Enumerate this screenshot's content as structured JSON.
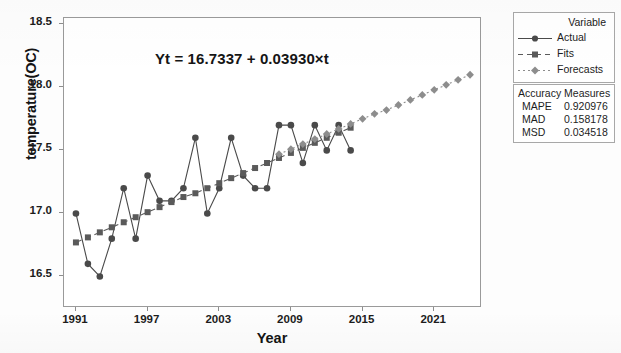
{
  "chart_data": {
    "type": "line",
    "title": "",
    "xlabel": "Year",
    "ylabel": "temperature(OC)",
    "annotation": "Yt = 16.7337 + 0.03930×t",
    "xlim": [
      1990,
      2025
    ],
    "ylim": [
      16.25,
      18.55
    ],
    "xticks": [
      "1991",
      "1997",
      "2003",
      "2009",
      "2015",
      "2021"
    ],
    "xtick_values": [
      1991,
      1997,
      2003,
      2009,
      2015,
      2021
    ],
    "yticks": [
      "16.5",
      "17.0",
      "17.5",
      "18.0",
      "18.5"
    ],
    "ytick_values": [
      16.5,
      17.0,
      17.5,
      18.0,
      18.5
    ],
    "grid": false,
    "legend_position": "right",
    "legend_title": "Variable",
    "series": [
      {
        "name": "Actual",
        "marker": "circle",
        "line": "solid",
        "color": "#4a4a4a",
        "x": [
          1991,
          1992,
          1993,
          1994,
          1995,
          1996,
          1997,
          1998,
          1999,
          2000,
          2001,
          2002,
          2003,
          2004,
          2005,
          2006,
          2007,
          2008,
          2009,
          2010,
          2011,
          2012,
          2013,
          2014
        ],
        "values": [
          17.0,
          16.6,
          16.5,
          16.8,
          17.2,
          16.8,
          17.3,
          17.1,
          17.1,
          17.2,
          17.6,
          17.0,
          17.2,
          17.6,
          17.3,
          17.2,
          17.2,
          17.7,
          17.7,
          17.4,
          17.7,
          17.5,
          17.7,
          17.5
        ]
      },
      {
        "name": "Fits",
        "marker": "square",
        "line": "dashed",
        "color": "#5a5a5a",
        "x": [
          1991,
          1992,
          1993,
          1994,
          1995,
          1996,
          1997,
          1998,
          1999,
          2000,
          2001,
          2002,
          2003,
          2004,
          2005,
          2006,
          2007,
          2008,
          2009,
          2010,
          2011,
          2012,
          2013,
          2014
        ],
        "values": [
          16.77,
          16.81,
          16.85,
          16.89,
          16.93,
          16.97,
          17.01,
          17.05,
          17.09,
          17.13,
          17.16,
          17.2,
          17.24,
          17.28,
          17.32,
          17.36,
          17.4,
          17.44,
          17.48,
          17.52,
          17.56,
          17.6,
          17.64,
          17.68
        ]
      },
      {
        "name": "Forecasts",
        "marker": "diamond",
        "line": "dashdot",
        "color": "#8d8d8d",
        "x": [
          2008,
          2009,
          2010,
          2011,
          2012,
          2013,
          2014,
          2015,
          2016,
          2017,
          2018,
          2019,
          2020,
          2021,
          2022,
          2023,
          2024
        ],
        "values": [
          17.47,
          17.51,
          17.55,
          17.59,
          17.63,
          17.67,
          17.71,
          17.75,
          17.79,
          17.82,
          17.86,
          17.9,
          17.94,
          17.98,
          18.02,
          18.06,
          18.1
        ]
      }
    ]
  },
  "legend": {
    "title": "Variable",
    "items": [
      {
        "label": "Actual",
        "style": "solid-circle"
      },
      {
        "label": "Fits",
        "style": "dashed-square"
      },
      {
        "label": "Forecasts",
        "style": "dashdot-diamond"
      }
    ]
  },
  "accuracy": {
    "title": "Accuracy Measures",
    "rows": [
      {
        "name": "MAPE",
        "value": "0.920976"
      },
      {
        "name": "MAD",
        "value": "0.158178"
      },
      {
        "name": "MSD",
        "value": "0.034518"
      }
    ]
  },
  "colors": {
    "actual": "#4a4a4a",
    "fits": "#5a5a5a",
    "forecasts": "#8d8d8d",
    "frame": "#9a9a9a"
  }
}
